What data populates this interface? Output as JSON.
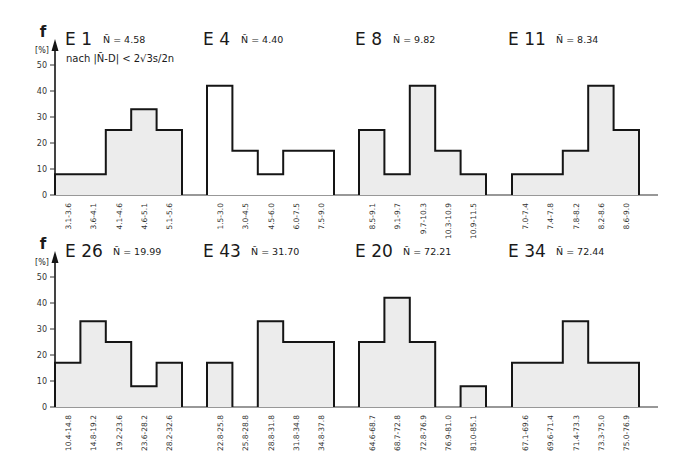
{
  "y_axis": {
    "label": "f",
    "unit": "[%]",
    "ticks": [
      0,
      10,
      20,
      30,
      40,
      50
    ]
  },
  "chart_data": [
    {
      "type": "bar",
      "id": "E1",
      "title": "E 1",
      "mean_label": "N̄ = 4.58",
      "note": "nach |N̄-D| < 2√3s/2n",
      "categories": [
        "3.1-3.6",
        "3.6-4.1",
        "4.1-4.6",
        "4.6-5.1",
        "5.1-5.6"
      ],
      "values": [
        8,
        8,
        25,
        33,
        25
      ],
      "filled": true,
      "ylabel": "f [%]",
      "ylim": [
        0,
        50
      ],
      "grid": false
    },
    {
      "type": "bar",
      "id": "E4",
      "title": "E 4",
      "mean_label": "N̄ = 4.40",
      "categories": [
        "1.5-3.0",
        "3.0-4.5",
        "4.5-6.0",
        "6.0-7.5",
        "7.5-9.0"
      ],
      "values": [
        42,
        17,
        8,
        17,
        17
      ],
      "filled": false,
      "ylabel": "f [%]",
      "ylim": [
        0,
        50
      ],
      "grid": false
    },
    {
      "type": "bar",
      "id": "E8",
      "title": "E 8",
      "mean_label": "N̄ = 9.82",
      "categories": [
        "8.5-9.1",
        "9.1-9.7",
        "9.7-10.3",
        "10.3-10.9",
        "10.9-11.5"
      ],
      "values": [
        25,
        8,
        42,
        17,
        8
      ],
      "filled": true,
      "ylabel": "f [%]",
      "ylim": [
        0,
        50
      ],
      "grid": false
    },
    {
      "type": "bar",
      "id": "E11",
      "title": "E 11",
      "mean_label": "N̄ = 8.34",
      "categories": [
        "7.0-7.4",
        "7.4-7.8",
        "7.8-8.2",
        "8.2-8.6",
        "8.6-9.0"
      ],
      "values": [
        8,
        8,
        17,
        42,
        25
      ],
      "filled": true,
      "ylabel": "f [%]",
      "ylim": [
        0,
        50
      ],
      "grid": false
    },
    {
      "type": "bar",
      "id": "E26",
      "title": "E 26",
      "mean_label": "N̄ = 19.99",
      "categories": [
        "10.4-14.8",
        "14.8-19.2",
        "19.2-23.6",
        "23.6-28.2",
        "28.2-32.6"
      ],
      "values": [
        17,
        33,
        25,
        8,
        17
      ],
      "filled": true,
      "ylabel": "f [%]",
      "ylim": [
        0,
        50
      ],
      "grid": false
    },
    {
      "type": "bar",
      "id": "E43",
      "title": "E 43",
      "mean_label": "N̄ = 31.70",
      "categories": [
        "22.8-25.8",
        "25.8-28.8",
        "28.8-31.8",
        "31.8-34.8",
        "34.8-37.8"
      ],
      "values": [
        17,
        0,
        33,
        25,
        25
      ],
      "filled": true,
      "ylabel": "f [%]",
      "ylim": [
        0,
        50
      ],
      "grid": false
    },
    {
      "type": "bar",
      "id": "E20",
      "title": "E 20",
      "mean_label": "N̄ = 72.21",
      "categories": [
        "64.6-68.7",
        "68.7-72.8",
        "72.8-76.9",
        "76.9-81.0",
        "81.0-85.1"
      ],
      "values": [
        25,
        42,
        25,
        0,
        8
      ],
      "filled": true,
      "ylabel": "f [%]",
      "ylim": [
        0,
        50
      ],
      "grid": false
    },
    {
      "type": "bar",
      "id": "E34",
      "title": "E 34",
      "mean_label": "N̄ = 72.44",
      "categories": [
        "67.1-69.6",
        "69.6-71.4",
        "71.4-73.3",
        "73.3-75.0",
        "75.0-76.9"
      ],
      "values": [
        17,
        17,
        33,
        17,
        17
      ],
      "filled": true,
      "ylabel": "f [%]",
      "ylim": [
        0,
        50
      ],
      "grid": false
    }
  ],
  "colors": {
    "fill": "#ececec",
    "stroke": "#151515",
    "axis": "#333333"
  }
}
